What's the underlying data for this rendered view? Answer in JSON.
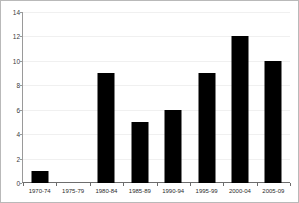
{
  "chart_data": {
    "type": "bar",
    "title": "",
    "title_clipped": true,
    "xlabel": "",
    "ylabel": "",
    "categories": [
      "1970-74",
      "1975-79",
      "1980-84",
      "1985-89",
      "1990-94",
      "1995-99",
      "2000-04",
      "2005-09"
    ],
    "values": [
      1,
      0,
      9,
      5,
      6,
      9,
      12,
      10
    ],
    "ylim": [
      0,
      14
    ],
    "yticks": [
      0,
      2,
      4,
      6,
      8,
      10,
      12,
      14
    ],
    "ytick_labels": [
      "0",
      "2",
      "4",
      "6",
      "8",
      "10",
      "12",
      "14"
    ],
    "grid": true,
    "legend": false,
    "legend_position": "none",
    "bar_color": "#000000",
    "plot_background": "#ffffff",
    "frame_color": "#b9b9b9",
    "gridline_color": "#f0f0f0",
    "axis_color": "#6d6d6d"
  }
}
